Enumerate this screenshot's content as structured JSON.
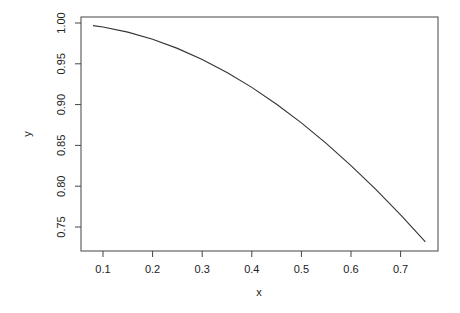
{
  "chart_data": {
    "type": "line",
    "title": "",
    "xlabel": "x",
    "ylabel": "y",
    "xlim": [
      0.0467,
      0.7833
    ],
    "ylim": [
      0.7175,
      1.0075
    ],
    "xticks": [
      0.1,
      0.2,
      0.3,
      0.4,
      0.5,
      0.6,
      0.7
    ],
    "xtick_labels": [
      "0.1",
      "0.2",
      "0.3",
      "0.4",
      "0.5",
      "0.6",
      "0.7"
    ],
    "yticks": [
      0.75,
      0.8,
      0.85,
      0.9,
      0.95,
      1.0
    ],
    "ytick_labels": [
      "0.75",
      "0.80",
      "0.85",
      "0.90",
      "0.95",
      "1.00"
    ],
    "grid": false,
    "legend": null,
    "series": [
      {
        "name": "y = cos(x)",
        "x": [
          0.08,
          0.1,
          0.15,
          0.2,
          0.25,
          0.3,
          0.35,
          0.4,
          0.45,
          0.5,
          0.55,
          0.6,
          0.65,
          0.7,
          0.75
        ],
        "values": [
          0.9968,
          0.995,
          0.9888,
          0.9801,
          0.9689,
          0.9553,
          0.9394,
          0.9211,
          0.9004,
          0.8776,
          0.8525,
          0.8253,
          0.7961,
          0.7648,
          0.7317
        ]
      }
    ]
  },
  "colors": {
    "line": "#333333",
    "axis": "#444444",
    "background": "#ffffff"
  }
}
